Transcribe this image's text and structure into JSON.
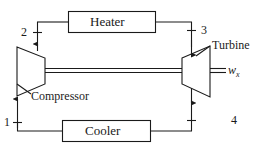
{
  "diagram": {
    "type": "thermodynamic-cycle-schematic",
    "background_color": "#ffffff",
    "line_color": "#1a1a1a",
    "text_color": "#1a1a1a",
    "components": {
      "heater": {
        "label": "Heater",
        "shape": "rectangle",
        "position": "top-center"
      },
      "cooler": {
        "label": "Cooler",
        "shape": "rectangle",
        "position": "bottom-center"
      },
      "compressor": {
        "label": "Compressor",
        "shape": "trapezoid-narrowing-right",
        "position": "left"
      },
      "turbine": {
        "label": "Turbine",
        "shape": "trapezoid-widening-right",
        "position": "right"
      },
      "shaft": {
        "label": "",
        "shape": "double-line",
        "position": "center-horizontal"
      }
    },
    "state_points": [
      {
        "label": "1",
        "position": "bottom-left",
        "flow_direction": "up"
      },
      {
        "label": "2",
        "position": "top-left",
        "flow_direction": "up"
      },
      {
        "label": "3",
        "position": "top-right",
        "flow_direction": "down"
      },
      {
        "label": "4",
        "position": "bottom-right",
        "flow_direction": "down"
      }
    ],
    "work_output": {
      "symbol": "w",
      "subscript": "x"
    },
    "flow_path": [
      "1 -> compressor -> 2",
      "2 -> heater -> 3",
      "3 -> turbine -> 4",
      "4 -> cooler -> 1"
    ]
  }
}
